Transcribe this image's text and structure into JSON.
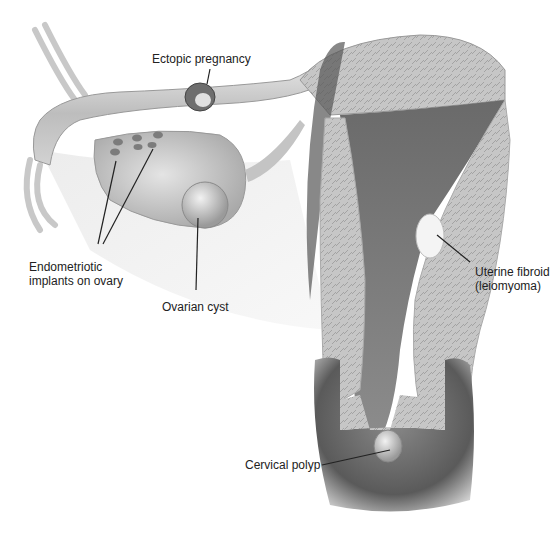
{
  "diagram": {
    "labels": {
      "ectopic": "Ectopic pregnancy",
      "endo_line1": "Endometriotic",
      "endo_line2": "implants on ovary",
      "cyst": "Ovarian cyst",
      "fibroid_line1": "Uterine fibroid",
      "fibroid_line2": "(leiomyoma)",
      "polyp": "Cervical polyp"
    },
    "colors": {
      "tissue_light": "#d8d8d8",
      "tissue_mid": "#a8a8a8",
      "tissue_dark": "#555555",
      "line": "#222222"
    }
  }
}
